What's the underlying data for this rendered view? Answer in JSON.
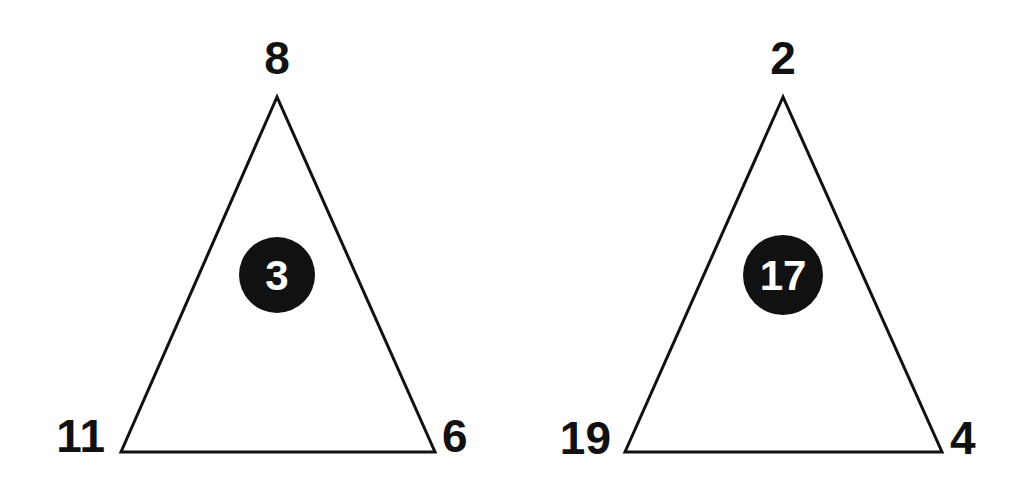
{
  "colors": {
    "background": "#ffffff",
    "stroke": "#111111",
    "circle_fill": "#111111",
    "inner_text": "#ffffff"
  },
  "triangles": [
    {
      "top": "8",
      "bottom_left": "11",
      "bottom_right": "6",
      "center": "3"
    },
    {
      "top": "2",
      "bottom_left": "19",
      "bottom_right": "4",
      "center": "17"
    }
  ]
}
